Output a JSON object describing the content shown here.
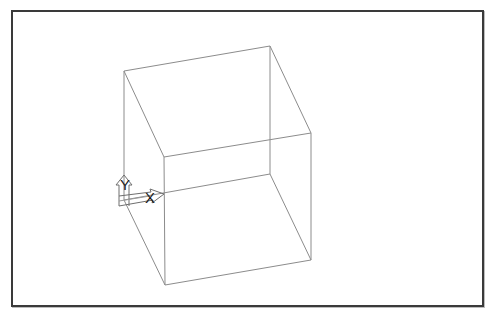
{
  "viewport": {
    "name": "model-space-viewport",
    "background": "#ffffff",
    "frame_color": "#3a3a3a",
    "edge_color": "#8c8c8c"
  },
  "ucs_icon": {
    "x_label": "X",
    "y_label": "Y"
  },
  "cube": {
    "vertices": {
      "top_back_left": [
        124,
        71
      ],
      "top_back_right": [
        270,
        46
      ],
      "top_front_right": [
        311,
        133
      ],
      "top_front_left": [
        164,
        157
      ],
      "bottom_back_left": [
        124,
        200
      ],
      "bottom_back_right": [
        270,
        174
      ],
      "bottom_front_right": [
        311,
        260
      ],
      "bottom_front_left": [
        165,
        285
      ]
    }
  }
}
